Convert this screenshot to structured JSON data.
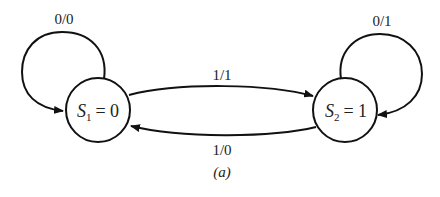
{
  "diagram": {
    "caption": "(a)",
    "states": [
      {
        "id": "S1",
        "symbol": "S",
        "subscript": "1",
        "output": "= 0"
      },
      {
        "id": "S2",
        "symbol": "S",
        "subscript": "2",
        "output": "= 1"
      }
    ],
    "transitions": [
      {
        "from": "S1",
        "to": "S1",
        "label": "0/0"
      },
      {
        "from": "S1",
        "to": "S2",
        "label": "1/1"
      },
      {
        "from": "S2",
        "to": "S1",
        "label": "1/0"
      },
      {
        "from": "S2",
        "to": "S2",
        "label": "0/1"
      }
    ]
  }
}
